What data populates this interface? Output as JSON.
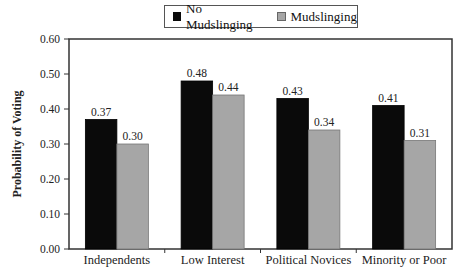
{
  "chart_data": {
    "type": "bar",
    "title": "",
    "xlabel": "",
    "ylabel": "Probability of Voting",
    "ylim": [
      0,
      0.6
    ],
    "yticks": [
      "0.00",
      "0.10",
      "0.20",
      "0.30",
      "0.40",
      "0.50",
      "0.60"
    ],
    "categories": [
      "Independents",
      "Low Interest",
      "Political Novices",
      "Minority or Poor"
    ],
    "series": [
      {
        "name": "No Mudslinging",
        "color": "#0a0a0a",
        "values": [
          0.37,
          0.48,
          0.43,
          0.41
        ],
        "labels": [
          "0.37",
          "0.48",
          "0.43",
          "0.41"
        ]
      },
      {
        "name": "Mudslinging",
        "color": "#a6a6a6",
        "values": [
          0.3,
          0.44,
          0.34,
          0.31
        ],
        "labels": [
          "0.30",
          "0.44",
          "0.34",
          "0.31"
        ]
      }
    ],
    "legend_position": "top",
    "grid": false
  },
  "legend": {
    "items": [
      "No Mudslinging",
      "Mudslinging"
    ]
  }
}
